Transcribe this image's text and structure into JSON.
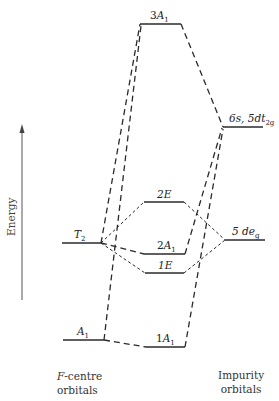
{
  "axis": {
    "label": "Energy"
  },
  "levels": {
    "f_centre": [
      {
        "id": "T2",
        "label": "T",
        "sub": "2"
      },
      {
        "id": "A1",
        "label": "A",
        "sub": "1"
      }
    ],
    "molecular": [
      {
        "id": "3A1",
        "prefix": "3",
        "label": "A",
        "sub": "1"
      },
      {
        "id": "2E",
        "label": "2E"
      },
      {
        "id": "2A1",
        "prefix": "2",
        "label": "A",
        "sub": "1"
      },
      {
        "id": "1E",
        "label": "1E"
      },
      {
        "id": "1A1",
        "prefix": "1",
        "label": "A",
        "sub": "1"
      }
    ],
    "impurity": [
      {
        "id": "6s5dt2g",
        "label_a": "6s, 5dt",
        "sub": "2g"
      },
      {
        "id": "5deg",
        "label_a": "5 de",
        "sub": "g"
      }
    ]
  },
  "captions": {
    "left_line1_italic": "F",
    "left_line1_rest": "-centre",
    "left_line2": "orbitals",
    "right_line1": "Impurity",
    "right_line2": "orbitals"
  },
  "colors": {
    "line": "#2a2a2a",
    "background": "#ffffff"
  }
}
